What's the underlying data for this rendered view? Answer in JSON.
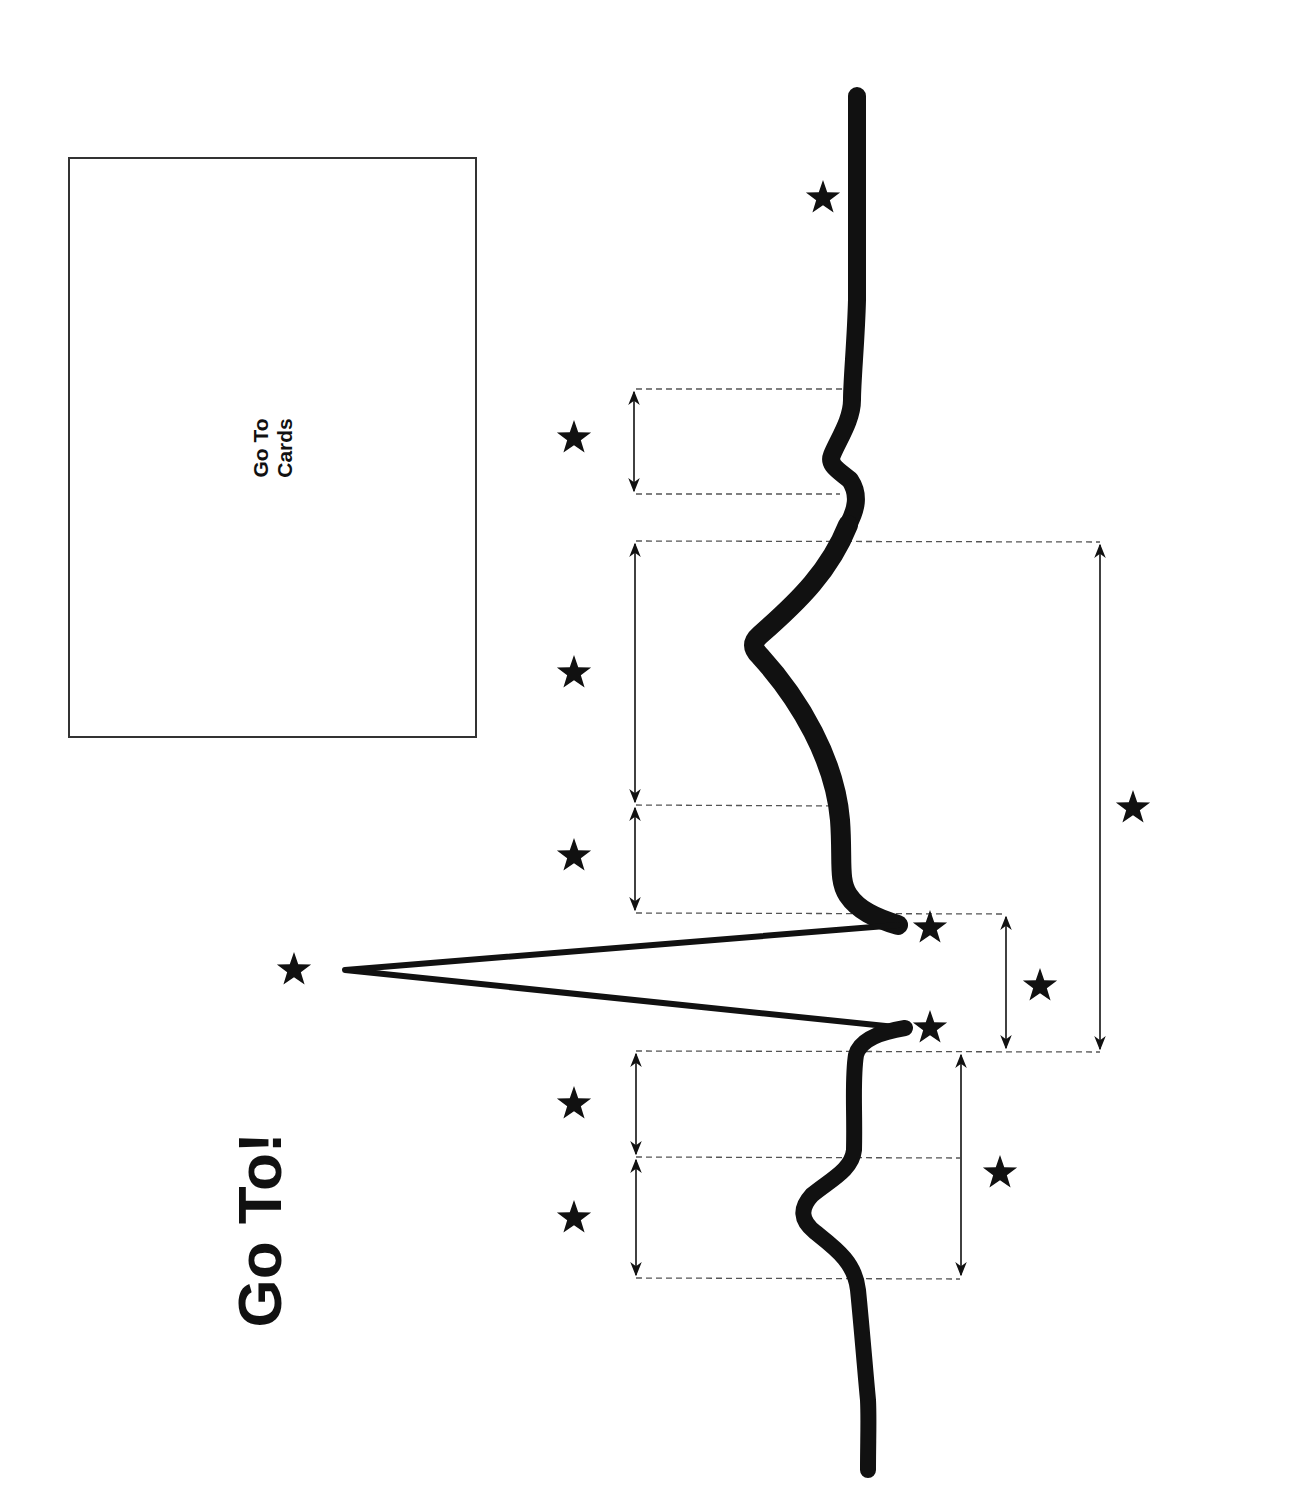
{
  "title": "Go To!",
  "card": {
    "line1": "Go To",
    "line2": "Cards"
  },
  "colors": {
    "background": "#ffffff",
    "ink": "#111111",
    "dash": "#555555",
    "box_border": "#333333"
  },
  "diagram": {
    "type": "ecg-waveform-rotated",
    "orientation": "rotated -90deg (time axis runs bottom to top)",
    "segments": [
      {
        "name": "baseline-start"
      },
      {
        "name": "p-wave"
      },
      {
        "name": "pr-segment"
      },
      {
        "name": "qrs-complex",
        "points": [
          "q-point",
          "r-peak",
          "s-point"
        ]
      },
      {
        "name": "st-segment"
      },
      {
        "name": "t-wave"
      },
      {
        "name": "u-wave"
      },
      {
        "name": "baseline-end"
      }
    ],
    "intervals": [
      {
        "name": "p-wave-duration"
      },
      {
        "name": "pr-segment-duration"
      },
      {
        "name": "pr-interval"
      },
      {
        "name": "qrs-duration"
      },
      {
        "name": "st-segment-duration"
      },
      {
        "name": "t-wave-duration"
      },
      {
        "name": "qt-interval"
      },
      {
        "name": "u-wave-duration"
      }
    ],
    "star_markers": 13
  }
}
